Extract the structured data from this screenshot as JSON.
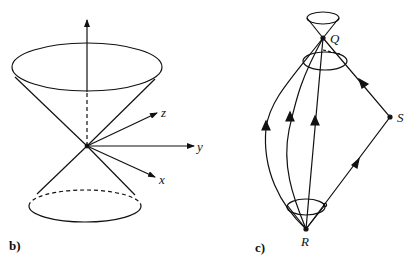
{
  "figure_b": {
    "panel_label": "b)",
    "axes": {
      "z": "z",
      "y": "y",
      "x": "x"
    }
  },
  "figure_c": {
    "panel_label": "c)",
    "points": {
      "Q": "Q",
      "R": "R",
      "S": "S"
    }
  },
  "colors": {
    "ink": "#111111",
    "background": "#ffffff"
  }
}
